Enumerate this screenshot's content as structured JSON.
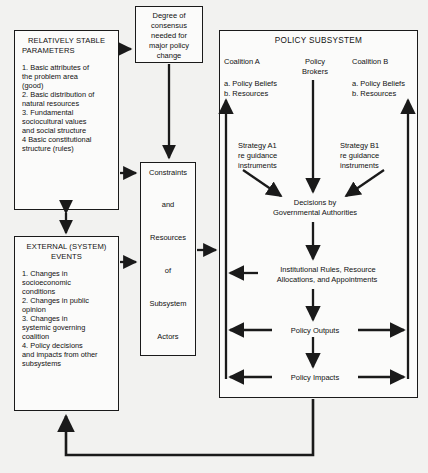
{
  "diagram": {
    "boxes": {
      "stable_parameters": {
        "heading_line1": "RELATIVELY STABLE",
        "heading_line2": "PARAMETERS",
        "items": [
          "1.  Basic attributes of",
          "the problem area",
          "(good)",
          "2.  Basic distribution of",
          "natural resources",
          "3.  Fundamental",
          "sociocultural values",
          "and social structure",
          "4  Basic constitutional",
          "structure (rules)"
        ]
      },
      "external_events": {
        "heading_line1": "EXTERNAL (SYSTEM)",
        "heading_line2": "EVENTS",
        "items": [
          "1.  Changes in",
          "socioeconomic",
          "conditions",
          "2.  Changes in public",
          "opinion",
          "3.  Changes in",
          "systemic governing",
          "coalition",
          "4.  Policy decisions",
          "and impacts from other",
          "subsystems"
        ]
      },
      "degree_of_consensus": {
        "lines": [
          "Degree of",
          "consensus",
          "needed for",
          "major policy",
          "change"
        ]
      },
      "constraints": {
        "lines": [
          "Constraints",
          "and",
          "Resources",
          "of",
          "Subsystem",
          "Actors"
        ]
      },
      "policy_subsystem": {
        "title": "POLICY SUBSYSTEM",
        "coalition_a": {
          "name": "Coalition A",
          "items": [
            "a. Policy Beliefs",
            "b. Resources"
          ],
          "strategy": [
            "Strategy A1",
            "re guidance",
            "instruments"
          ]
        },
        "policy_brokers": {
          "name_line1": "Policy",
          "name_line2": "Brokers"
        },
        "coalition_b": {
          "name": "Coalition B",
          "items": [
            "a. Policy Beliefs",
            "b. Resources"
          ],
          "strategy": [
            "Strategy B1",
            "re guidance",
            "instruments"
          ]
        },
        "decisions": {
          "line1": "Decisions by",
          "line2": "Governmental Authorities"
        },
        "institutional": {
          "line1": "Institutional Rules, Resource",
          "line2": "Allocations, and Appointments"
        },
        "policy_outputs": "Policy Outputs",
        "policy_impacts": "Policy Impacts"
      }
    },
    "colors": {
      "stroke": "#1a1a1a",
      "box_fill": "#fbfbfa",
      "background": "#f2f2f0"
    }
  }
}
